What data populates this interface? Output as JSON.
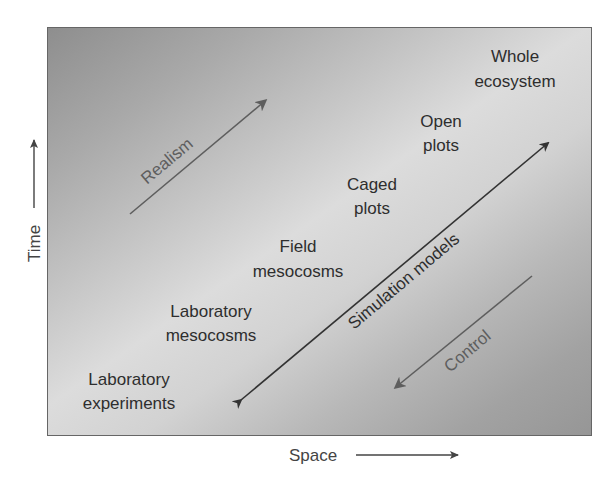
{
  "diagram": {
    "axes": {
      "x_label": "Space",
      "y_label": "Time"
    },
    "categories": [
      {
        "line1": "Laboratory",
        "line2": "experiments"
      },
      {
        "line1": "Laboratory",
        "line2": "mesocosms"
      },
      {
        "line1": "Field",
        "line2": "mesocosms"
      },
      {
        "line1": "Caged",
        "line2": "plots"
      },
      {
        "line1": "Open",
        "line2": "plots"
      },
      {
        "line1": "Whole",
        "line2": "ecosystem"
      }
    ],
    "arrows": {
      "realism": {
        "label": "Realism",
        "direction": "up-right"
      },
      "simulation_models": {
        "label": "Simulation models",
        "direction": "bidirectional"
      },
      "control": {
        "label": "Control",
        "direction": "down-left"
      }
    },
    "colors": {
      "text_dark": "#2e2e2e",
      "text_muted": "#5e5e5e",
      "border": "#666666",
      "gradient_dark": "#8e8e8e",
      "gradient_light": "#dcdcdc"
    }
  }
}
